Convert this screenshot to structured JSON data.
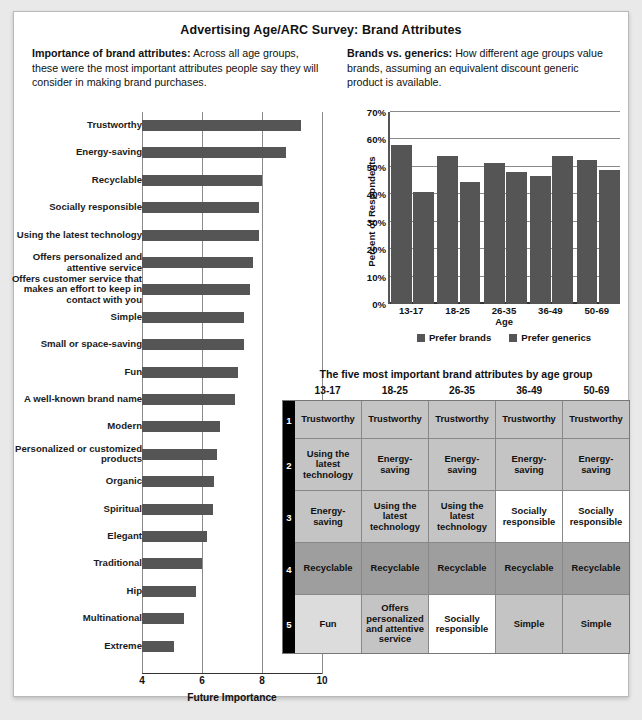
{
  "title": "Advertising Age/ARC Survey: Brand Attributes",
  "intro_left": {
    "heading": "Importance of brand attributes:",
    "body": "Across all age groups, these were the most important attributes people say they will consider in making brand purchases."
  },
  "intro_right": {
    "heading": "Brands vs. generics:",
    "body": "How different age groups value brands, assuming an equivalent discount generic product is available."
  },
  "chart_data": [
    {
      "type": "bar",
      "orientation": "horizontal",
      "title": "Importance of brand attributes",
      "xlabel": "Future Importance",
      "ylabel": "",
      "xlim": [
        4,
        10
      ],
      "xticks": [
        4,
        6,
        8,
        10
      ],
      "grid": true,
      "categories": [
        "Trustworthy",
        "Energy-saving",
        "Recyclable",
        "Socially responsible",
        "Using the latest technology",
        "Offers personalized and attentive service",
        "Offers customer service that makes an effort to keep in contact with you",
        "Simple",
        "Small or space-saving",
        "Fun",
        "A well-known brand name",
        "Modern",
        "Personalized or customized products",
        "Organic",
        "Spiritual",
        "Elegant",
        "Traditional",
        "Hip",
        "Multinational",
        "Extreme"
      ],
      "values": [
        9.3,
        8.8,
        8.0,
        7.9,
        7.9,
        7.7,
        7.6,
        7.4,
        7.4,
        7.2,
        7.1,
        6.6,
        6.5,
        6.4,
        6.35,
        6.15,
        6.0,
        5.8,
        5.4,
        5.05
      ]
    },
    {
      "type": "bar",
      "orientation": "vertical",
      "title": "Brands vs. generics",
      "xlabel": "Age",
      "ylabel": "Percent of Respondents",
      "ylim": [
        0,
        70
      ],
      "yticks": [
        "0%",
        "10%",
        "20%",
        "30%",
        "40%",
        "50%",
        "60%",
        "70%"
      ],
      "grid": true,
      "legend_position": "bottom",
      "categories": [
        "13-17",
        "18-25",
        "26-35",
        "36-49",
        "50-69"
      ],
      "series": [
        {
          "name": "Prefer brands",
          "values": [
            58,
            54,
            51.5,
            46.5,
            52.5
          ]
        },
        {
          "name": "Prefer generics",
          "values": [
            41,
            44.5,
            48,
            54,
            49
          ]
        }
      ]
    }
  ],
  "table": {
    "title": "The five most important brand attributes by age group",
    "columns": [
      "13-17",
      "18-25",
      "26-35",
      "36-49",
      "50-69"
    ],
    "ranks": [
      "1",
      "2",
      "3",
      "4",
      "5"
    ],
    "rows": [
      {
        "cells": [
          "Trustworthy",
          "Trustworthy",
          "Trustworthy",
          "Trustworthy",
          "Trustworthy"
        ],
        "shades": [
          "sh-mid",
          "sh-mid",
          "sh-mid",
          "sh-mid",
          "sh-mid"
        ]
      },
      {
        "cells": [
          "Using the latest technology",
          "Energy-saving",
          "Energy-saving",
          "Energy-saving",
          "Energy-saving"
        ],
        "shades": [
          "sh-mid",
          "sh-mid",
          "sh-mid",
          "sh-mid",
          "sh-mid"
        ]
      },
      {
        "cells": [
          "Energy-saving",
          "Using the latest technology",
          "Using the latest technology",
          "Socially responsible",
          "Socially responsible"
        ],
        "shades": [
          "sh-mid",
          "sh-mid",
          "sh-mid",
          "sh-white",
          "sh-white"
        ]
      },
      {
        "cells": [
          "Recyclable",
          "Recyclable",
          "Recyclable",
          "Recyclable",
          "Recyclable"
        ],
        "shades": [
          "sh-dark",
          "sh-dark",
          "sh-dark",
          "sh-dark",
          "sh-dark"
        ]
      },
      {
        "cells": [
          "Fun",
          "Offers personalized and attentive service",
          "Socially responsible",
          "Simple",
          "Simple"
        ],
        "shades": [
          "sh-light",
          "sh-mid",
          "sh-white",
          "sh-mid",
          "sh-mid"
        ]
      }
    ]
  },
  "colors": {
    "bar_fill": "#555555",
    "gridline": "#8a8a8a",
    "axis": "#333333",
    "rank_strip": "#000000"
  }
}
